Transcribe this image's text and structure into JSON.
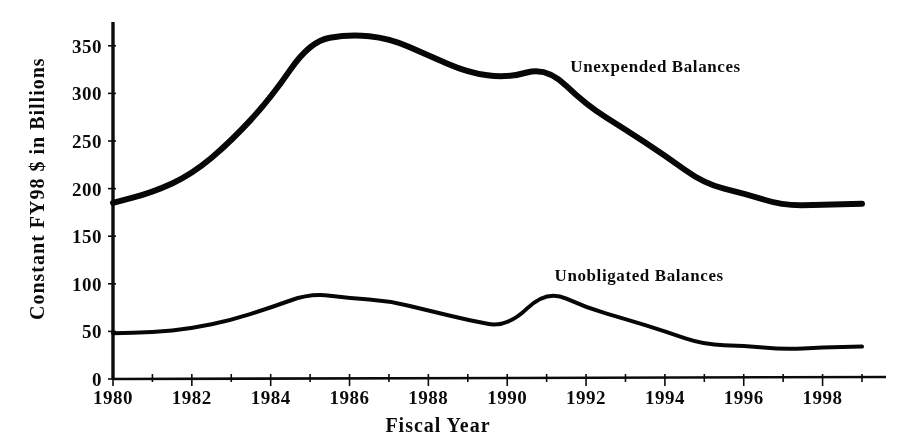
{
  "chart_data": {
    "type": "line",
    "title": "",
    "xlabel": "Fiscal Year",
    "ylabel": "Constant FY98 $ in Billions",
    "xlim": [
      1980,
      1999
    ],
    "ylim": [
      0,
      375
    ],
    "yticks": [
      0,
      50,
      100,
      150,
      200,
      250,
      300,
      350
    ],
    "ytick_labels": [
      "0",
      "50",
      "100",
      "150",
      "200",
      "250",
      "300",
      "350"
    ],
    "x": [
      1980,
      1981,
      1982,
      1983,
      1984,
      1985,
      1986,
      1987,
      1988,
      1989,
      1990,
      1991,
      1992,
      1993,
      1994,
      1995,
      1996,
      1997,
      1998,
      1999
    ],
    "xtick_labels": [
      "1980",
      "1982",
      "1984",
      "1986",
      "1988",
      "1990",
      "1992",
      "1994",
      "1996",
      "1998"
    ],
    "xticks": [
      1980,
      1982,
      1984,
      1986,
      1988,
      1990,
      1992,
      1994,
      1996,
      1998
    ],
    "grid": false,
    "legend": "inline-annotations",
    "series": [
      {
        "name": "Unexpended Balances",
        "label_x": 1991.6,
        "label_y": 322,
        "stroke_width": 6,
        "values": [
          185,
          196,
          215,
          250,
          295,
          355,
          362,
          358,
          340,
          322,
          316,
          328,
          288,
          262,
          235,
          205,
          195,
          182,
          183,
          184
        ]
      },
      {
        "name": "Unobligated Balances",
        "label_x": 1991.2,
        "label_y": 103,
        "stroke_width": 4,
        "values": [
          48,
          49,
          53,
          62,
          75,
          90,
          85,
          82,
          72,
          62,
          54,
          94,
          75,
          63,
          50,
          36,
          35,
          31,
          33,
          34
        ]
      }
    ]
  },
  "axis": {
    "y_title": "Constant FY98 $ in Billions",
    "x_title": "Fiscal Year"
  },
  "series_labels": {
    "upper": "Unexpended Balances",
    "lower": "Unobligated Balances"
  }
}
